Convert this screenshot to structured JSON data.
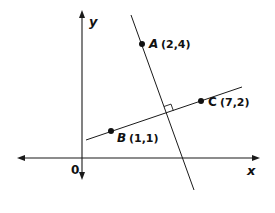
{
  "diagram": {
    "type": "coordinate-geometry",
    "axes": {
      "x_label": "x",
      "y_label": "y",
      "origin_label": "0"
    },
    "points": [
      {
        "name": "A",
        "coords": "(2,4)",
        "x": 2,
        "y": 4
      },
      {
        "name": "B",
        "coords": "(1,1)",
        "x": 1,
        "y": 1
      },
      {
        "name": "C",
        "coords": "(7,2)",
        "x": 7,
        "y": 2
      }
    ],
    "lines": [
      {
        "id": "line-bc",
        "through": [
          "B",
          "C"
        ]
      },
      {
        "id": "line-perpendicular",
        "through": [
          "A"
        ],
        "perpendicular_to": "line-bc"
      }
    ],
    "annotations": {
      "right_angle_marker": true
    }
  }
}
